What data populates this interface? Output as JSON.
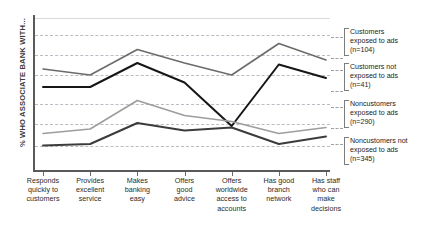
{
  "chart_data": {
    "type": "line",
    "title": "",
    "xlabel": "",
    "ylabel": "% WHO ASSOCIATE BANK WITH...",
    "grid": true,
    "legend_position": "right",
    "categories": [
      "Responds quickly to customers",
      "Provides excellent service",
      "Makes banking easy",
      "Offers good advice",
      "Offers worldwide access to accounts",
      "Has good branch network",
      "Has staff who make decisions"
    ],
    "ylim": [
      0,
      100
    ],
    "series": [
      {
        "name": "Customers exposed to ads",
        "n": 104,
        "color": "#6b6b6b",
        "values": [
          66,
          62,
          79,
          70,
          62,
          83,
          72
        ]
      },
      {
        "name": "Customers not exposed to ads",
        "n": 41,
        "color": "#161616",
        "values": [
          54,
          54,
          70,
          57,
          28,
          69,
          60
        ]
      },
      {
        "name": "Noncustomers exposed to ads",
        "n": 290,
        "color": "#9d9d9d",
        "values": [
          23,
          26,
          45,
          35,
          31,
          23,
          27
        ]
      },
      {
        "name": "Noncustomers not exposed to ads",
        "n": 345,
        "color": "#3c3c3c",
        "values": [
          15,
          16,
          30,
          25,
          27,
          16,
          21
        ]
      }
    ]
  },
  "axis": {
    "y_title": "% WHO ASSOCIATE BANK WITH..."
  },
  "legend": {
    "entries": [
      {
        "label": "Customers exposed to ads (n=104)",
        "line1": "Customers",
        "line2": "exposed to ads",
        "line3": "(n=104)"
      },
      {
        "label": "Customers not exposed to ads (n=41)",
        "line1": "Customers not",
        "line2": "exposed to ads",
        "line3": "(n=41)"
      },
      {
        "label": "Noncustomers exposed to ads (n=290)",
        "line1": "Noncustomers",
        "line2": "exposed to ads",
        "line3": "(n=290)"
      },
      {
        "label": "Noncustomers not exposed to ads (n=345)",
        "line1": "Noncustomers not",
        "line2": "exposed to ads",
        "line3": "(n=345)"
      }
    ]
  },
  "xaxis": {
    "labels": [
      {
        "l1": "Responds",
        "l2": "quickly to",
        "l3": "customers",
        "l4": ""
      },
      {
        "l1": "Provides",
        "l2": "excellent",
        "l3": "service",
        "l4": ""
      },
      {
        "l1": "Makes",
        "l2": "banking",
        "l3": "easy",
        "l4": ""
      },
      {
        "l1": "Offers",
        "l2": "good",
        "l3": "advice",
        "l4": ""
      },
      {
        "l1": "Offers",
        "l2": "worldwide",
        "l3": "access to",
        "l4": "accounts"
      },
      {
        "l1": "Has good",
        "l2": "branch",
        "l3": "network",
        "l4": ""
      },
      {
        "l1": "Has staff",
        "l2": "who can",
        "l3": "make",
        "l4": "decisions"
      }
    ]
  }
}
